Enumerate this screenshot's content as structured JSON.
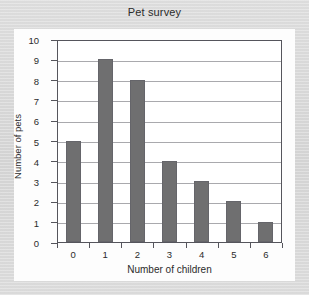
{
  "card": {
    "background_color": "#fdfdfd",
    "page_background_color": "#d6d6d6"
  },
  "chart_data": {
    "type": "bar",
    "title": "Pet survey",
    "xlabel": "Number of children",
    "ylabel": "Number of pets",
    "categories": [
      "0",
      "1",
      "2",
      "3",
      "4",
      "5",
      "6"
    ],
    "values": [
      5,
      9,
      8,
      4,
      3,
      2,
      1
    ],
    "ylim": [
      0,
      10
    ],
    "y_ticks": [
      "0",
      "1",
      "2",
      "3",
      "4",
      "5",
      "6",
      "7",
      "8",
      "9",
      "10"
    ],
    "y_tick_step": 1,
    "grid": true,
    "grid_axis": "y",
    "grid_color": "#a9a9ad",
    "legend": null,
    "bar_color": "#6f6f70",
    "bar_edge_color": "#65656a",
    "axis_color": "#55555c",
    "plot_background_color": "#ffffff"
  }
}
